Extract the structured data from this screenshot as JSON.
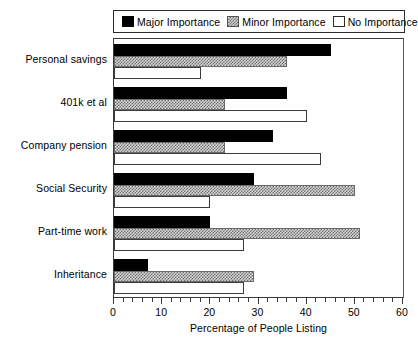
{
  "chart_data": {
    "type": "bar",
    "orientation": "horizontal",
    "title": "",
    "xlabel": "Percentage of People Listing",
    "ylabel": "",
    "xlim": [
      0,
      60
    ],
    "xticks": [
      0,
      10,
      20,
      30,
      40,
      50,
      60
    ],
    "xtick_labels": [
      "0",
      "10",
      "20",
      "30",
      "40",
      "50",
      "60"
    ],
    "minor_tick_step": 2,
    "grid": false,
    "legend_position": "top",
    "categories": [
      "Personal savings",
      "401k et al",
      "Company pension",
      "Social Security",
      "Part-time work",
      "Inheritance"
    ],
    "series": [
      {
        "name": "Major Importance",
        "color": "#000000",
        "fill": "solid",
        "values": [
          45,
          36,
          33,
          29,
          20,
          7
        ]
      },
      {
        "name": "Minor Importance",
        "color": "#cccccc",
        "fill": "checker",
        "values": [
          36,
          23,
          23,
          50,
          51,
          29
        ]
      },
      {
        "name": "No Importance",
        "color": "#ffffff",
        "fill": "empty",
        "values": [
          18,
          40,
          43,
          20,
          27,
          27
        ]
      }
    ]
  },
  "legend": {
    "items": [
      {
        "label": "Major Importance",
        "swatch": "solid-black-swatch"
      },
      {
        "label": "Minor Importance",
        "swatch": "checkered-gray-swatch"
      },
      {
        "label": "No Importance",
        "swatch": "empty-white-swatch"
      }
    ]
  },
  "axis": {
    "x_title": "Percentage of People Listing",
    "x_tick_labels": [
      "0",
      "10",
      "20",
      "30",
      "40",
      "50",
      "60"
    ],
    "y_tick_labels": [
      "Personal savings",
      "401k et al",
      "Company pension",
      "Social Security",
      "Part-time work",
      "Inheritance"
    ]
  }
}
